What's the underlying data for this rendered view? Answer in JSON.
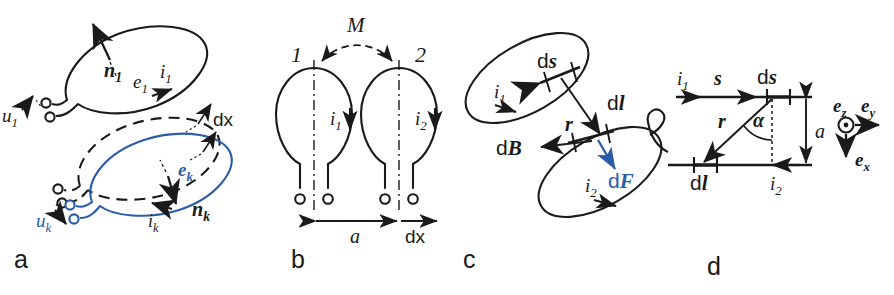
{
  "figure": {
    "stroke_color": "#1a1a1a",
    "accent_color": "#2a5caa",
    "background": "#ffffff",
    "width": 894,
    "height": 295
  },
  "panels": [
    {
      "id": "a",
      "letter": "a",
      "description": "Two conducting loops, loop 1 solid black and loop k in blue displaced by dx from its dashed original position",
      "labels": {
        "u1": "u",
        "u1_sub": "1",
        "n1": "n",
        "n1_sub": "1",
        "e1": "e",
        "e1_sub": "1",
        "i1": "i",
        "i1_sub": "1",
        "uk": "u",
        "uk_sub": "k",
        "nk": "n",
        "nk_sub": "k",
        "ek": "e",
        "ek_sub": "k",
        "ik": "i",
        "ik_sub": "k",
        "dx_1": "dx",
        "dx_2": "dx"
      }
    },
    {
      "id": "b",
      "letter": "b",
      "description": "Two vertical coils 1 and 2 separated by distance a, coupled by mutual inductance M, with virtual displacement dx",
      "labels": {
        "coil1": "1",
        "coil2": "2",
        "M": "M",
        "i1": "i",
        "i1_sub": "1",
        "i2": "i",
        "i2_sub": "2",
        "a": "a",
        "dx": "dx"
      }
    },
    {
      "id": "c",
      "letter": "c",
      "description": "Two tilted current loops; element ds of loop 1 produces field dB at element dl of loop 2 giving force dF",
      "labels": {
        "i1": "i",
        "i1_sub": "1",
        "i2": "i",
        "i2_sub": "2",
        "ds": "d",
        "ds_vec": "s",
        "dl": "d",
        "dl_vec": "l",
        "r": "r",
        "dB": "d",
        "dB_vec": "B",
        "dF": "d",
        "dF_vec": "F"
      }
    },
    {
      "id": "d",
      "letter": "d",
      "description": "Two parallel straight conductors separated by a, with position s, elements ds and dl, distance vector r at angle alpha, and unit vector triad",
      "labels": {
        "i1": "i",
        "i1_sub": "1",
        "i2": "i",
        "i2_sub": "2",
        "s": "s",
        "ds": "d",
        "ds_vec": "s",
        "dl": "d",
        "dl_vec": "l",
        "r": "r",
        "alpha": "α",
        "a": "a",
        "ex": "e",
        "ex_sub": "x",
        "ey": "e",
        "ey_sub": "y",
        "ez": "e",
        "ez_sub": "z"
      }
    }
  ]
}
